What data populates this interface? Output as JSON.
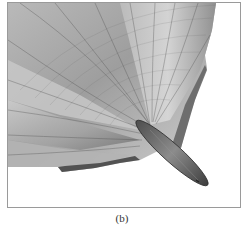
{
  "figure": {
    "panel_label": "(b)",
    "colors": {
      "frame": "#9a9a9a",
      "background": "#ffffff",
      "surface_light": "#d8d8d8",
      "surface_mid": "#a9a9a9",
      "surface_dark": "#5a5a5a",
      "body": "#6e6e6e",
      "mesh_line": "#4a4a4a"
    }
  }
}
